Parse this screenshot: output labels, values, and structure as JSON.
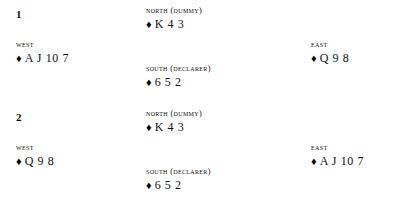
{
  "page": {
    "background_color": "#ffffff",
    "text_color": "#111111"
  },
  "suit": {
    "name": "diamonds",
    "symbol": "♦",
    "color": "#000000"
  },
  "deals": [
    {
      "number": "1",
      "north": {
        "label": "NORTH (DUMMY)",
        "suit": "♦",
        "ranks": "K 4 3"
      },
      "west": {
        "label": "WEST",
        "suit": "♦",
        "ranks": "A J 10 7"
      },
      "east": {
        "label": "EAST",
        "suit": "♦",
        "ranks": "Q 9 8"
      },
      "south": {
        "label": "SOUTH (DECLARER)",
        "suit": "♦",
        "ranks": "6 5 2"
      }
    },
    {
      "number": "2",
      "north": {
        "label": "NORTH (DUMMY)",
        "suit": "♦",
        "ranks": "K 4 3"
      },
      "west": {
        "label": "WEST",
        "suit": "♦",
        "ranks": "Q 9 8"
      },
      "east": {
        "label": "EAST",
        "suit": "♦",
        "ranks": "A J 10 7"
      },
      "south": {
        "label": "SOUTH (DECLARER)",
        "suit": "♦",
        "ranks": "6 5 2"
      }
    }
  ]
}
